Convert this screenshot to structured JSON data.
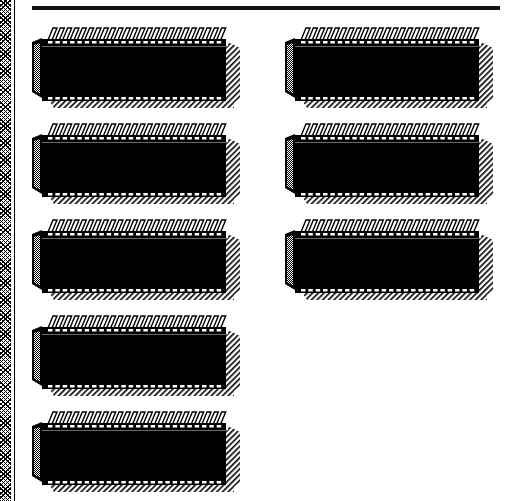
{
  "window": {
    "decoration": "checkered-left-border",
    "top_rule": true
  },
  "colors": {
    "ink": "#000000",
    "paper": "#ffffff",
    "rule": "#111111"
  },
  "chip_style": {
    "pins_per_side": 24,
    "icon": "dip-chip-icon"
  },
  "chips": [
    {
      "id": "chip-1",
      "column": 1,
      "row": 1,
      "x": 30,
      "y": 22
    },
    {
      "id": "chip-2",
      "column": 1,
      "row": 2,
      "x": 30,
      "y": 118
    },
    {
      "id": "chip-3",
      "column": 1,
      "row": 3,
      "x": 30,
      "y": 214
    },
    {
      "id": "chip-4",
      "column": 1,
      "row": 4,
      "x": 30,
      "y": 310
    },
    {
      "id": "chip-5",
      "column": 1,
      "row": 5,
      "x": 30,
      "y": 406
    },
    {
      "id": "chip-6",
      "column": 2,
      "row": 1,
      "x": 283,
      "y": 22
    },
    {
      "id": "chip-7",
      "column": 2,
      "row": 2,
      "x": 283,
      "y": 118
    },
    {
      "id": "chip-8",
      "column": 2,
      "row": 3,
      "x": 283,
      "y": 214
    }
  ]
}
